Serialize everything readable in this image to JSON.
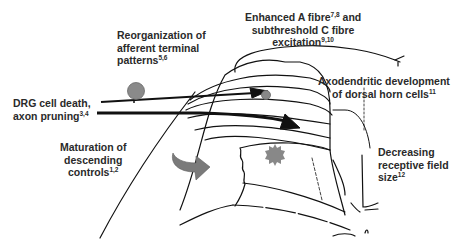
{
  "labels": {
    "reorg": {
      "line1": "Reorganization of",
      "line2": "afferent terminal",
      "line3": "patterns",
      "sup": "5,6"
    },
    "fibre": {
      "line1a": "Enhanced A fibre",
      "sup1": "7,8",
      "line1b": " and",
      "line2": "subthreshold C fibre",
      "line3": "excitation",
      "sup2": "9,10"
    },
    "drg": {
      "line1": "DRG cell death,",
      "line2": "axon pruning",
      "sup": "3,4"
    },
    "axo": {
      "line1": "Axodendritic development",
      "line2": "of dorsal horn cells",
      "sup": "11"
    },
    "descending": {
      "line1": "Maturation of",
      "line2": "descending",
      "line3": "controls",
      "sup": "1,2"
    },
    "receptive": {
      "line1": "Decreasing",
      "line2": "receptive field",
      "line3": "size",
      "sup": "12"
    }
  },
  "colors": {
    "line": "#111111",
    "marker": "#8a8a8a",
    "curved_arrow": "#7a7a7a",
    "text": "#2a2a2a"
  }
}
